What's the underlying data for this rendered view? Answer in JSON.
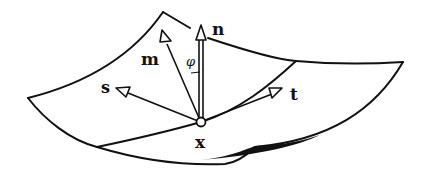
{
  "diagram": {
    "labels": {
      "normal": "n",
      "mean_direction": "m",
      "vector_s": "s",
      "vector_t": "t",
      "point": "x",
      "angle": "φ"
    },
    "colors": {
      "stroke": "#111111",
      "background": "#ffffff"
    }
  }
}
